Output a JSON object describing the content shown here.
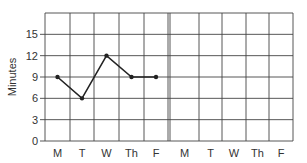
{
  "chart_data": {
    "type": "line",
    "title": "",
    "xlabel": "",
    "ylabel": "Minutes",
    "categories": [
      "M",
      "T",
      "W",
      "Th",
      "F",
      "M",
      "T",
      "W",
      "Th",
      "F"
    ],
    "series": [
      {
        "name": "Week 1",
        "values": [
          9,
          6,
          12,
          9,
          9,
          null,
          null,
          null,
          null,
          null
        ]
      }
    ],
    "yticks": [
      0,
      3,
      6,
      9,
      12,
      15
    ],
    "ylim": [
      0,
      18
    ],
    "grid": true,
    "legend": "none"
  },
  "colors": {
    "line": "#222222",
    "grid": "#444444",
    "text": "#333333"
  }
}
